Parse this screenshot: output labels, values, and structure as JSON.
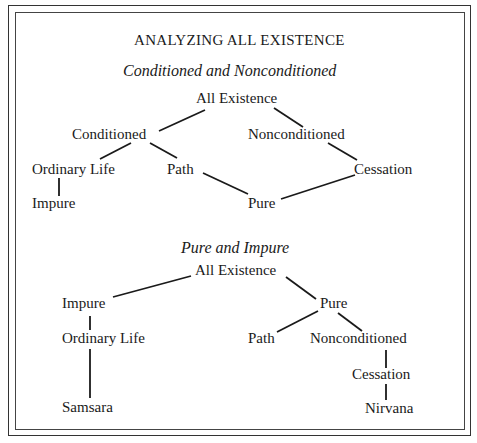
{
  "title": "ANALYZING ALL EXISTENCE",
  "diagram1": {
    "subtitle": "Conditioned and Nonconditioned",
    "nodes": {
      "root": "All Existence",
      "conditioned": "Conditioned",
      "nonconditioned": "Nonconditioned",
      "ordinary_life": "Ordinary Life",
      "path": "Path",
      "cessation": "Cessation",
      "impure": "Impure",
      "pure": "Pure"
    },
    "edges": [
      [
        "All Existence",
        "Conditioned"
      ],
      [
        "All Existence",
        "Nonconditioned"
      ],
      [
        "Conditioned",
        "Ordinary Life"
      ],
      [
        "Conditioned",
        "Path"
      ],
      [
        "Nonconditioned",
        "Cessation"
      ],
      [
        "Ordinary Life",
        "Impure"
      ],
      [
        "Path",
        "Pure"
      ],
      [
        "Cessation",
        "Pure"
      ]
    ]
  },
  "diagram2": {
    "subtitle": "Pure and Impure",
    "nodes": {
      "root": "All Existence",
      "impure": "Impure",
      "pure": "Pure",
      "ordinary_life": "Ordinary Life",
      "samsara": "Samsara",
      "path": "Path",
      "nonconditioned": "Nonconditioned",
      "cessation": "Cessation",
      "nirvana": "Nirvana"
    },
    "edges": [
      [
        "All Existence",
        "Impure"
      ],
      [
        "All Existence",
        "Pure"
      ],
      [
        "Impure",
        "Ordinary Life"
      ],
      [
        "Ordinary Life",
        "Samsara"
      ],
      [
        "Pure",
        "Path"
      ],
      [
        "Pure",
        "Nonconditioned"
      ],
      [
        "Nonconditioned",
        "Cessation"
      ],
      [
        "Cessation",
        "Nirvana"
      ]
    ]
  }
}
